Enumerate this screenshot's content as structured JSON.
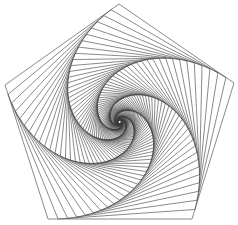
{
  "figure": {
    "type": "nested-rotating-pentagon-spiral",
    "width": 238,
    "height": 225,
    "background": "#ffffff",
    "stroke_color": "#3a3a3a",
    "stroke_width": 0.6,
    "outer_pentagon": [
      [
        119,
        4
      ],
      [
        5,
        85
      ],
      [
        48,
        219
      ],
      [
        192,
        219
      ],
      [
        234,
        83
      ]
    ],
    "center": [
      118,
      122
    ],
    "step_fraction": 0.07,
    "iterations": 90
  }
}
